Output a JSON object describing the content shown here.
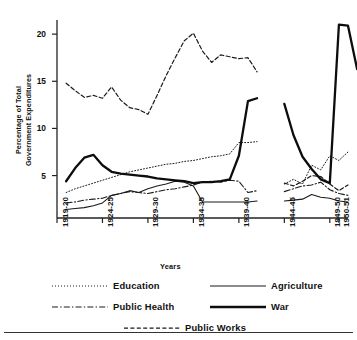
{
  "axes": {
    "ylabel_line1": "Percentage of Total",
    "ylabel_line2": "Government Expenditures",
    "xlabel": "Years",
    "yticks": [
      "5",
      "10",
      "15",
      "20"
    ],
    "xticks": [
      "1919-20",
      "1924-25",
      "1929-30",
      "1934-35",
      "1939-40",
      "1944-45",
      "1949-50",
      "1950-51"
    ]
  },
  "legend": {
    "education": "Education",
    "public_health": "Public Health",
    "public_works": "Public Works",
    "agriculture": "Agriculture",
    "war": "War"
  },
  "chart_data": {
    "type": "line",
    "title": "",
    "xlabel": "Years",
    "ylabel": "Percentage of Total Government Expenditures",
    "xlim": [
      1919,
      1951
    ],
    "ylim": [
      0.5,
      21.5
    ],
    "yticks": [
      5,
      10,
      15,
      20
    ],
    "xtick_values": [
      1919,
      1924,
      1929,
      1934,
      1939,
      1944,
      1949,
      1950
    ],
    "xtick_labels": [
      "1919-20",
      "1924-25",
      "1929-30",
      "1934-35",
      "1939-40",
      "1944-45",
      "1949-50",
      "1950-51"
    ],
    "grid": false,
    "legend_position": "below-axes",
    "note": "Series are broken between 1940-41 and 1943-44 (war-years data gap).",
    "series": [
      {
        "name": "Education",
        "style": "dotted",
        "width": 1.0,
        "color": "#1a1a1a",
        "points": [
          [
            1920,
            3.2
          ],
          [
            1921,
            3.6
          ],
          [
            1922,
            3.9
          ],
          [
            1923,
            4.2
          ],
          [
            1924,
            4.5
          ],
          [
            1925,
            4.8
          ],
          [
            1926,
            5.1
          ],
          [
            1927,
            5.4
          ],
          [
            1928,
            5.6
          ],
          [
            1929,
            5.8
          ],
          [
            1930,
            6.0
          ],
          [
            1931,
            6.2
          ],
          [
            1932,
            6.3
          ],
          [
            1933,
            6.5
          ],
          [
            1934,
            6.6
          ],
          [
            1935,
            6.8
          ],
          [
            1936,
            7.0
          ],
          [
            1937,
            7.1
          ],
          [
            1938,
            7.3
          ],
          [
            1939,
            8.5
          ],
          [
            1940,
            8.5
          ],
          [
            1941,
            8.6
          ],
          [
            1944,
            4.1
          ],
          [
            1945,
            4.6
          ],
          [
            1946,
            4.1
          ],
          [
            1947,
            6.1
          ],
          [
            1948,
            5.6
          ],
          [
            1949,
            7.1
          ],
          [
            1950,
            6.6
          ],
          [
            1951,
            7.5
          ]
        ]
      },
      {
        "name": "Public Health",
        "style": "dashdot",
        "width": 1.1,
        "color": "#1a1a1a",
        "points": [
          [
            1920,
            2.1
          ],
          [
            1921,
            2.2
          ],
          [
            1922,
            2.4
          ],
          [
            1923,
            2.5
          ],
          [
            1924,
            2.6
          ],
          [
            1925,
            2.9
          ],
          [
            1926,
            3.1
          ],
          [
            1927,
            3.3
          ],
          [
            1928,
            3.2
          ],
          [
            1929,
            3.1
          ],
          [
            1930,
            3.3
          ],
          [
            1931,
            3.5
          ],
          [
            1932,
            3.6
          ],
          [
            1933,
            3.8
          ],
          [
            1934,
            4.0
          ],
          [
            1935,
            4.3
          ],
          [
            1936,
            4.4
          ],
          [
            1937,
            4.3
          ],
          [
            1938,
            4.5
          ],
          [
            1939,
            4.4
          ],
          [
            1940,
            3.2
          ],
          [
            1941,
            3.4
          ],
          [
            1944,
            3.3
          ],
          [
            1945,
            3.6
          ],
          [
            1946,
            3.9
          ],
          [
            1947,
            4.0
          ],
          [
            1948,
            4.3
          ],
          [
            1949,
            3.5
          ],
          [
            1950,
            3.1
          ],
          [
            1951,
            2.9
          ]
        ]
      },
      {
        "name": "Public Works",
        "style": "dashed",
        "width": 1.2,
        "color": "#1a1a1a",
        "points": [
          [
            1920,
            14.8
          ],
          [
            1921,
            14.0
          ],
          [
            1922,
            13.3
          ],
          [
            1923,
            13.5
          ],
          [
            1924,
            13.2
          ],
          [
            1925,
            14.4
          ],
          [
            1926,
            13.0
          ],
          [
            1927,
            12.2
          ],
          [
            1928,
            12.0
          ],
          [
            1929,
            11.5
          ],
          [
            1930,
            13.5
          ],
          [
            1931,
            15.6
          ],
          [
            1932,
            17.5
          ],
          [
            1933,
            19.3
          ],
          [
            1934,
            20.1
          ],
          [
            1935,
            18.2
          ],
          [
            1936,
            17.0
          ],
          [
            1937,
            17.8
          ],
          [
            1938,
            17.6
          ],
          [
            1939,
            17.4
          ],
          [
            1940,
            17.5
          ],
          [
            1941,
            16.0
          ],
          [
            1944,
            4.2
          ],
          [
            1945,
            3.9
          ],
          [
            1946,
            4.4
          ],
          [
            1947,
            5.0
          ],
          [
            1948,
            4.9
          ],
          [
            1949,
            4.1
          ],
          [
            1950,
            3.4
          ],
          [
            1951,
            4.0
          ]
        ]
      },
      {
        "name": "Agriculture",
        "style": "solid",
        "width": 1.1,
        "color": "#1a1a1a",
        "points": [
          [
            1920,
            1.4
          ],
          [
            1921,
            1.5
          ],
          [
            1922,
            1.6
          ],
          [
            1923,
            1.8
          ],
          [
            1924,
            2.1
          ],
          [
            1925,
            2.9
          ],
          [
            1926,
            3.1
          ],
          [
            1927,
            3.4
          ],
          [
            1928,
            3.2
          ],
          [
            1929,
            3.6
          ],
          [
            1930,
            3.9
          ],
          [
            1931,
            4.1
          ],
          [
            1932,
            4.4
          ],
          [
            1933,
            4.3
          ],
          [
            1934,
            3.9
          ],
          [
            1935,
            2.2
          ],
          [
            1936,
            2.2
          ],
          [
            1937,
            2.2
          ],
          [
            1938,
            2.2
          ],
          [
            1939,
            2.2
          ],
          [
            1940,
            2.2
          ],
          [
            1941,
            2.3
          ],
          [
            1944,
            2.3
          ],
          [
            1945,
            2.4
          ],
          [
            1946,
            2.5
          ],
          [
            1947,
            3.0
          ],
          [
            1948,
            2.7
          ],
          [
            1949,
            2.6
          ],
          [
            1950,
            2.3
          ],
          [
            1951,
            2.2
          ]
        ]
      },
      {
        "name": "War",
        "style": "solid",
        "width": 2.3,
        "color": "#0d0d0d",
        "points": [
          [
            1920,
            4.4
          ],
          [
            1921,
            5.8
          ],
          [
            1922,
            6.9
          ],
          [
            1923,
            7.2
          ],
          [
            1924,
            6.1
          ],
          [
            1925,
            5.4
          ],
          [
            1926,
            5.2
          ],
          [
            1927,
            5.1
          ],
          [
            1928,
            5.0
          ],
          [
            1929,
            4.9
          ],
          [
            1930,
            4.7
          ],
          [
            1931,
            4.6
          ],
          [
            1932,
            4.5
          ],
          [
            1933,
            4.4
          ],
          [
            1934,
            4.2
          ],
          [
            1935,
            4.3
          ],
          [
            1936,
            4.3
          ],
          [
            1937,
            4.4
          ],
          [
            1938,
            4.6
          ],
          [
            1939,
            7.1
          ],
          [
            1940,
            12.9
          ],
          [
            1941,
            13.2
          ],
          [
            1944,
            12.6
          ],
          [
            1945,
            9.3
          ],
          [
            1946,
            7.0
          ],
          [
            1947,
            5.7
          ],
          [
            1948,
            4.6
          ],
          [
            1949,
            4.2
          ],
          [
            1950,
            21.0
          ],
          [
            1951,
            20.9
          ],
          [
            1952,
            16.3
          ]
        ]
      }
    ]
  }
}
